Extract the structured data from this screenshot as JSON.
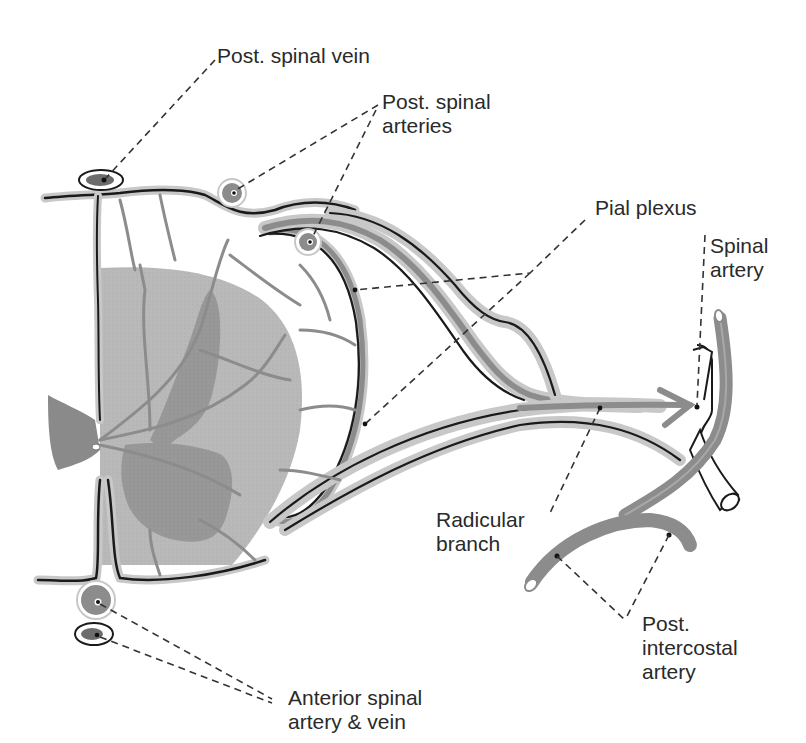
{
  "figure": {
    "colors": {
      "background": "#ffffff",
      "white_matter": "#bdbdbd",
      "gray_matter": "#9a9a9a",
      "vessel_fill": "#8c8c8c",
      "vessel_halo": "#c8c8c8",
      "outline": "#1a1a1a",
      "leader_line": "#333333"
    }
  },
  "labels": {
    "post_spinal_vein": {
      "text": "Post. spinal vein"
    },
    "post_spinal_arteries": {
      "line1": "Post. spinal",
      "line2": "arteries"
    },
    "pial_plexus": {
      "text": "Pial plexus"
    },
    "spinal_artery": {
      "line1": "Spinal",
      "line2": "artery"
    },
    "radicular_branch": {
      "line1": "Radicular",
      "line2": "branch"
    },
    "post_intercostal_artery": {
      "line1": "Post.",
      "line2": "intercostal",
      "line3": "artery"
    },
    "anterior_spinal_artery_vein": {
      "line1": "Anterior spinal",
      "line2": "artery & vein"
    }
  }
}
